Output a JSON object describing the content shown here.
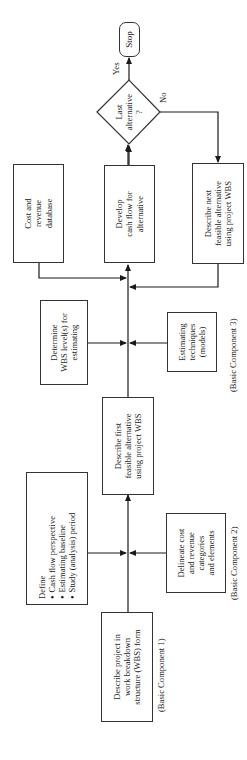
{
  "diagram": {
    "orientation": "rotated 90 degrees counter-clockwise",
    "nodes": {
      "describe_project": {
        "text": "Describe project in\nwork breakdown\nstructure (WBS) form"
      },
      "define": {
        "title": "Define",
        "bullets": [
          "Cash flow perspective",
          "Estimating baseline",
          "Study (analysis) period"
        ]
      },
      "delineate": {
        "text": "Delineate cost\nand revenue\ncategories\nand elements"
      },
      "describe_first": {
        "text": "Describe first\nfeasible alternative\nusing project WBS"
      },
      "determine_wbs": {
        "text": "Determine\nWBS level(s) for\nestimating"
      },
      "estimating_techniques": {
        "text": "Estimating\ntechniques\n(models)"
      },
      "cost_revenue_db": {
        "text": "Cost and\nrevenue\ndatabase"
      },
      "develop_cash_flow": {
        "text": "Develop\ncash flow for\nalternative"
      },
      "describe_next": {
        "text": "Describe next\nfeasible alternative\nusing project WBS"
      },
      "last_alternative": {
        "text": "Last\nalternative\n?"
      },
      "stop": {
        "text": "Stop"
      }
    },
    "labels": {
      "component1": "(Basic Component 1)",
      "component2": "(Basic Component 2)",
      "component3": "(Basic Component 3)",
      "yes": "Yes",
      "no": "No"
    },
    "colors": {
      "line": "#1a1a1a",
      "border": "#333333",
      "background": "#ffffff"
    }
  }
}
